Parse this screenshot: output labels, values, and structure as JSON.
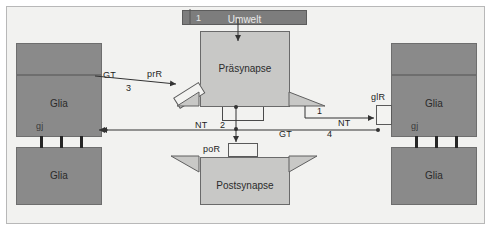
{
  "diagram": {
    "title_visible": false,
    "background_color": "#f2f2f0",
    "block_fill_grey": "#8a8a8a",
    "block_fill_mid": "#c8c8c6",
    "line_color": "#333333"
  },
  "blocks": {
    "umwelt": {
      "label": "Umwelt",
      "tag": "1"
    },
    "praesynapse": {
      "label": "Präsynapse"
    },
    "postsynapse": {
      "label": "Postsynapse"
    },
    "glia_left_upper": {
      "label": "Glia"
    },
    "glia_left_lower": {
      "label": "Glia"
    },
    "glia_right_upper": {
      "label": "Glia"
    },
    "glia_right_lower": {
      "label": "Glia"
    },
    "gap_junction_left": {
      "label": "gj"
    },
    "gap_junction_right": {
      "label": "gj"
    }
  },
  "receptors": {
    "presynaptic": {
      "label": "prR"
    },
    "postsynaptic": {
      "label": "poR"
    },
    "glial": {
      "label": "glR"
    }
  },
  "signals": {
    "nt_to_postsynapse": {
      "transmitter": "NT",
      "step": "2"
    },
    "nt_to_glia": {
      "transmitter": "NT",
      "step": "1"
    },
    "gt_from_glia_right": {
      "transmitter": "GT",
      "step": "4"
    },
    "gt_to_presynapse": {
      "transmitter": "GT",
      "step": "3"
    }
  }
}
